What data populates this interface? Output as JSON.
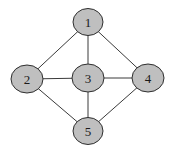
{
  "diagram": {
    "type": "undirected-graph",
    "colors": {
      "background": "#ffffff",
      "node_fill": "#bfbfbf",
      "node_stroke": "#2e2e2e",
      "edge": "#3a3a3a",
      "label": "#1a1a1a"
    },
    "nodes": [
      {
        "id": "1",
        "label": "1",
        "cx": 88,
        "cy": 22,
        "rx": 15,
        "ry": 13.5
      },
      {
        "id": "2",
        "label": "2",
        "cx": 27,
        "cy": 79,
        "rx": 16,
        "ry": 14
      },
      {
        "id": "3",
        "label": "3",
        "cx": 88,
        "cy": 78,
        "rx": 16,
        "ry": 14
      },
      {
        "id": "4",
        "label": "4",
        "cx": 148,
        "cy": 78,
        "rx": 16,
        "ry": 14
      },
      {
        "id": "5",
        "label": "5",
        "cx": 88,
        "cy": 131,
        "rx": 15,
        "ry": 13.5
      }
    ],
    "edges": [
      {
        "from": "1",
        "to": "2"
      },
      {
        "from": "1",
        "to": "3"
      },
      {
        "from": "1",
        "to": "4"
      },
      {
        "from": "2",
        "to": "3"
      },
      {
        "from": "3",
        "to": "4"
      },
      {
        "from": "2",
        "to": "5"
      },
      {
        "from": "3",
        "to": "5"
      },
      {
        "from": "4",
        "to": "5"
      }
    ]
  }
}
